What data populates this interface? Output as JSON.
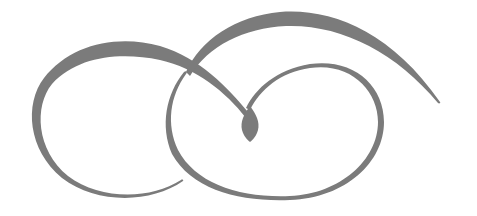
{
  "graphic": {
    "description": "Decorative calligraphic swirl flourish",
    "stroke_color": "#7b7b7b",
    "background": "#ffffff",
    "elements": [
      "left-loop-stroke",
      "right-loop-stroke",
      "top-arc-stroke",
      "center-teardrop"
    ]
  }
}
